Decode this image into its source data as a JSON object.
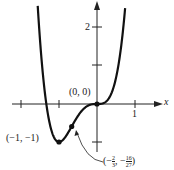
{
  "figure": {
    "function": "f(x) = 3x^4 + 4x^3",
    "axes": {
      "x_label": "x",
      "x_tick_labels": [
        "1"
      ],
      "y_tick_labels": [
        "2"
      ]
    },
    "points": {
      "origin": {
        "label": "(0, 0)",
        "x": 0,
        "y": 0
      },
      "minimum": {
        "label": "(−1, −1)",
        "x": -1,
        "y": -1
      },
      "inflection": {
        "label_prefix": "(−",
        "x_num": "2",
        "x_den": "3",
        "mid": ", −",
        "y_num": "16",
        "y_den": "27",
        "label_suffix": ")",
        "x": -0.6667,
        "y": -0.5926
      }
    },
    "colors": {
      "curve": "#111111",
      "axis": "#222222"
    }
  },
  "chart_data": {
    "type": "line",
    "title": "",
    "xlabel": "x",
    "ylabel": "",
    "series": [
      {
        "name": "f(x) = 3x^4 + 4x^3",
        "x": [
          -1.55,
          -1.4,
          -1.3,
          -1.2,
          -1.1,
          -1.0,
          -0.9,
          -0.8,
          -0.6667,
          -0.5,
          -0.4,
          -0.3,
          -0.2,
          -0.1,
          0,
          0.1,
          0.2,
          0.3,
          0.4,
          0.5,
          0.6,
          0.7,
          0.74
        ],
        "y": [
          2.4,
          0.55,
          -0.21,
          -0.69,
          -0.93,
          -1.0,
          -0.95,
          -0.82,
          -0.59,
          -0.31,
          -0.18,
          -0.08,
          -0.03,
          -0.004,
          0,
          0.004,
          0.04,
          0.13,
          0.33,
          0.69,
          1.25,
          2.09,
          2.5
        ]
      }
    ],
    "annotations": [
      {
        "text": "(0, 0)",
        "x": 0,
        "y": 0
      },
      {
        "text": "(−1, −1)",
        "x": -1,
        "y": -1
      },
      {
        "text": "(−2/3, −16/27)",
        "x": -0.6667,
        "y": -0.5926
      }
    ],
    "xlim": [
      -2.2,
      1.6
    ],
    "ylim": [
      -1.7,
      2.7
    ],
    "x_ticks": [
      -2,
      -1,
      1
    ],
    "x_tick_labels": [
      "",
      "",
      "1"
    ],
    "y_ticks": [
      -1,
      1,
      2
    ],
    "y_tick_labels": [
      "",
      "",
      "2"
    ],
    "grid": false,
    "legend": "none"
  }
}
